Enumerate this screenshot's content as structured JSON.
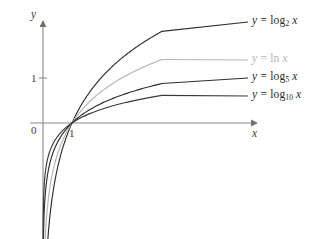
{
  "chart_data": {
    "type": "line",
    "title": "",
    "xlabel": "x",
    "ylabel": "y",
    "xlim": [
      0,
      4.1
    ],
    "ylim": [
      -2.4,
      2.45
    ],
    "grid": false,
    "legend_position": "right-of-curve-ends",
    "x_ticks": [
      {
        "value": 1,
        "label": "1"
      }
    ],
    "y_ticks": [
      {
        "value": 1,
        "label": "1"
      }
    ],
    "origin_label": "0",
    "series": [
      {
        "name": "log2",
        "label_html": "<span class=\"var\">y</span> = log<sub>2</sub> <span class=\"var\">x</span>",
        "base": 2,
        "color": "#2e2e2e",
        "x": [
          0.12,
          0.16,
          0.2,
          0.25,
          0.3,
          0.4,
          0.5,
          0.65,
          0.8,
          1.0,
          1.2,
          1.5,
          1.8,
          2.2,
          2.6,
          3.0,
          3.4,
          3.8,
          4.0
        ],
        "y": [
          -3.06,
          -2.64,
          -2.32,
          -2.0,
          -1.74,
          -1.32,
          -1.0,
          -0.62,
          -0.32,
          0.0,
          0.26,
          0.58,
          0.85,
          1.14,
          1.38,
          1.58,
          1.77,
          1.93,
          2.0
        ]
      },
      {
        "name": "ln",
        "label_html": "<span class=\"var\">y</span> = <span class=\"op\">ln</span> <span class=\"var\">x</span>",
        "base": 2.718281828,
        "color": "#b4b4b4",
        "x": [
          0.12,
          0.16,
          0.2,
          0.25,
          0.3,
          0.4,
          0.5,
          0.65,
          0.8,
          1.0,
          1.2,
          1.5,
          1.8,
          2.2,
          2.6,
          3.0,
          3.4,
          3.8,
          4.0
        ],
        "y": [
          -2.12,
          -1.83,
          -1.61,
          -1.39,
          -1.2,
          -0.92,
          -0.69,
          -0.43,
          -0.22,
          0.0,
          0.18,
          0.41,
          0.59,
          0.79,
          0.96,
          1.1,
          1.22,
          1.34,
          1.39
        ]
      },
      {
        "name": "log5",
        "label_html": "<span class=\"var\">y</span> = log<sub>5</sub> <span class=\"var\">x</span>",
        "base": 5,
        "color": "#2e2e2e",
        "x": [
          0.12,
          0.16,
          0.2,
          0.25,
          0.3,
          0.4,
          0.5,
          0.65,
          0.8,
          1.0,
          1.2,
          1.5,
          1.8,
          2.2,
          2.6,
          3.0,
          3.4,
          3.8,
          4.0
        ],
        "y": [
          -1.32,
          -1.14,
          -1.0,
          -0.86,
          -0.75,
          -0.57,
          -0.43,
          -0.27,
          -0.14,
          0.0,
          0.11,
          0.25,
          0.37,
          0.49,
          0.59,
          0.68,
          0.76,
          0.83,
          0.86
        ]
      },
      {
        "name": "log10",
        "label_html": "<span class=\"var\">y</span> = log<sub>10</sub> <span class=\"var\">x</span>",
        "base": 10,
        "color": "#3a3a3a",
        "x": [
          0.12,
          0.16,
          0.2,
          0.25,
          0.3,
          0.4,
          0.5,
          0.65,
          0.8,
          1.0,
          1.2,
          1.5,
          1.8,
          2.2,
          2.6,
          3.0,
          3.4,
          3.8,
          4.0
        ],
        "y": [
          -0.92,
          -0.8,
          -0.7,
          -0.6,
          -0.52,
          -0.4,
          -0.3,
          -0.19,
          -0.1,
          0.0,
          0.08,
          0.18,
          0.26,
          0.34,
          0.41,
          0.48,
          0.53,
          0.58,
          0.6
        ]
      }
    ]
  },
  "axes": {
    "y_axis_name": "y",
    "x_axis_name": "x",
    "origin_label": "0",
    "x_tick_one": "1",
    "y_tick_one": "1"
  },
  "colors": {
    "axis": "#8a8a8a",
    "curve_dark": "#2e2e2e",
    "curve_light": "#b4b4b4",
    "background": "#ffffff"
  }
}
